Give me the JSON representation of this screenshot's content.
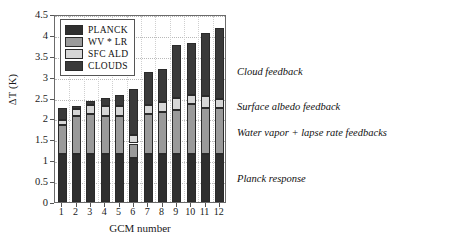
{
  "chart_data": {
    "type": "bar",
    "stacked": true,
    "title": "",
    "xlabel": "GCM number",
    "ylabel": "ΔT (K)",
    "categories": [
      "1",
      "2",
      "3",
      "4",
      "5",
      "6",
      "7",
      "8",
      "9",
      "10",
      "11",
      "12"
    ],
    "ylim": [
      0,
      4.5
    ],
    "yticks": [
      "0",
      "0.5",
      "1",
      "1.5",
      "2",
      "2.5",
      "3",
      "3.5",
      "4",
      "4.5"
    ],
    "ytick_values": [
      0,
      0.5,
      1,
      1.5,
      2,
      2.5,
      3,
      3.5,
      4,
      4.5
    ],
    "grid": true,
    "legend_position": "top-left",
    "series": [
      {
        "name": "PLANCK",
        "color": "#2f2f2f",
        "values": [
          1.15,
          1.15,
          1.15,
          1.15,
          1.15,
          1.05,
          1.15,
          1.15,
          1.15,
          1.15,
          1.15,
          1.15
        ]
      },
      {
        "name": "WV * LR",
        "color": "#9a9a9a",
        "values": [
          0.7,
          0.9,
          0.95,
          0.9,
          0.9,
          0.35,
          0.95,
          1.0,
          1.05,
          1.2,
          1.1,
          1.1
        ]
      },
      {
        "name": "SFC ALD",
        "color": "#d6d6d6",
        "values": [
          0.12,
          0.18,
          0.22,
          0.25,
          0.25,
          0.2,
          0.22,
          0.25,
          0.3,
          0.2,
          0.28,
          0.22
        ]
      },
      {
        "name": "CLOUDS",
        "color": "#3a3a3a",
        "values": [
          0.28,
          0.07,
          0.1,
          0.18,
          0.25,
          1.1,
          0.8,
          0.78,
          1.25,
          1.25,
          1.52,
          1.7
        ]
      }
    ],
    "totals": [
      2.25,
      2.3,
      2.42,
      2.48,
      2.55,
      2.7,
      3.12,
      3.18,
      3.75,
      3.8,
      4.05,
      4.17
    ],
    "annotations": [
      {
        "text": "Cloud feedback",
        "x": 237,
        "y": 66
      },
      {
        "text": "Surface albedo feedback",
        "x": 237,
        "y": 101
      },
      {
        "text": "Water vapor + lapse rate feedbacks",
        "x": 237,
        "y": 127
      },
      {
        "text": "Planck response",
        "x": 237,
        "y": 173
      }
    ]
  },
  "legend": {
    "items": [
      {
        "label": "PLANCK",
        "color": "#2f2f2f"
      },
      {
        "label": "WV * LR",
        "color": "#9a9a9a"
      },
      {
        "label": "SFC ALD",
        "color": "#d6d6d6"
      },
      {
        "label": "CLOUDS",
        "color": "#3a3a3a"
      }
    ]
  },
  "colors": {
    "planck": "#2f2f2f",
    "wv_lr": "#9a9a9a",
    "sfc_ald": "#d6d6d6",
    "clouds": "#3a3a3a",
    "axis": "#6b6b6b",
    "grid": "#b9b9b9",
    "text": "#111111",
    "background": "#ffffff"
  }
}
